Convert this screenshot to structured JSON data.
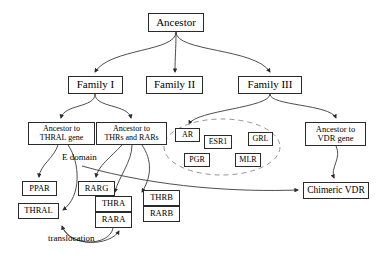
{
  "diagram": {
    "type": "phylogenetic-evolution-tree",
    "colors": {
      "background": "#ffffff",
      "node_border": "#2a2a2a",
      "node_fill": "#ffffff",
      "edge": "#3a3a3a",
      "text": "#000000",
      "dashed_group": "#8a8a8a"
    },
    "nodes": {
      "ancestor": "Ancestor",
      "family_1": "Family I",
      "family_2": "Family II",
      "family_3": "Family III",
      "ancestor_to_thral_gene": "Ancestor to\nTHRAL gene",
      "ancestor_to_thrs_and_rars": "Ancestor to\nTHRs and RARs",
      "ancestor_to_vdr_gene": "Ancestor to\nVDR gene",
      "ar": "AR",
      "esr1": "ESR1",
      "grl": "GRL",
      "pgr": "PGR",
      "mlr": "MLR",
      "chimeric_vdr": "Chimeric VDR",
      "ppar": "PPAR",
      "thral": "THRAL",
      "rarg": "RARG",
      "thra": "THRA",
      "rara": "RARA",
      "thrb": "THRB",
      "rarb": "RARB"
    },
    "edge_labels": {
      "e_domain": "E domain",
      "translocation": "translocation"
    },
    "groups": {
      "family_3_steroid_cluster": [
        "AR",
        "ESR1",
        "GRL",
        "PGR",
        "MLR"
      ]
    },
    "edges": [
      {
        "from": "Ancestor",
        "to": "Family I"
      },
      {
        "from": "Ancestor",
        "to": "Family II"
      },
      {
        "from": "Ancestor",
        "to": "Family III"
      },
      {
        "from": "Family I",
        "to": "Ancestor to THRAL gene"
      },
      {
        "from": "Family I",
        "to": "Ancestor to THRs and RARs"
      },
      {
        "from": "Family III",
        "to": "AR"
      },
      {
        "from": "Family III",
        "to": "Ancestor to VDR gene"
      },
      {
        "from": "Ancestor to THRAL gene",
        "to": "PPAR"
      },
      {
        "from": "Ancestor to THRAL gene",
        "to": "THRAL"
      },
      {
        "from": "Ancestor to THRs and RARs",
        "to": "RARG"
      },
      {
        "from": "Ancestor to THRs and RARs",
        "to": "THRA"
      },
      {
        "from": "Ancestor to THRs and RARs",
        "to": "THRB"
      },
      {
        "from": "Ancestor to THRs and RARs",
        "to": "Chimeric VDR"
      },
      {
        "from": "Ancestor to VDR gene",
        "to": "Chimeric VDR"
      },
      {
        "from": "RARA",
        "to": "THRAL",
        "label": "translocation"
      }
    ]
  }
}
